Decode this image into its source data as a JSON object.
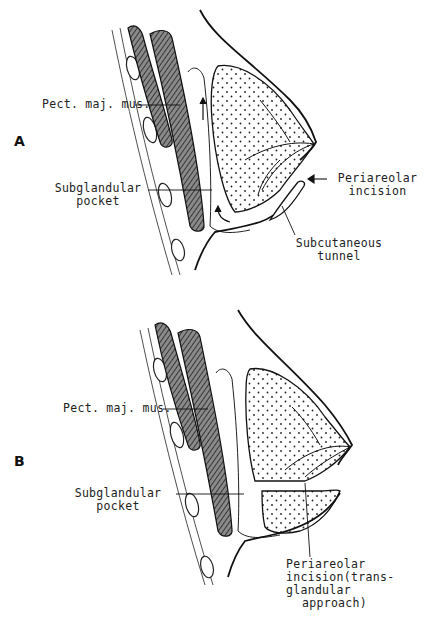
{
  "figure": {
    "panels": [
      {
        "letter": "A",
        "labels": {
          "muscle": "Pect. maj. mus.",
          "pocket_line1": "Subglandular",
          "pocket_line2": "pocket",
          "incision_line1": "Periareolar",
          "incision_line2": "incision",
          "tunnel_line1": "Subcutaneous",
          "tunnel_line2": "tunnel"
        }
      },
      {
        "letter": "B",
        "labels": {
          "muscle": "Pect. maj. mus.",
          "pocket_line1": "Subglandular",
          "pocket_line2": "pocket",
          "incision_line1": "Periareolar",
          "incision_line2": "incision(trans-",
          "incision_line3": "glandular",
          "incision_line4": "approach)"
        }
      }
    ],
    "caption": "",
    "colors": {
      "ink": "#1a1a1a",
      "background": "#ffffff"
    }
  }
}
